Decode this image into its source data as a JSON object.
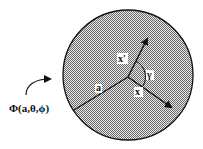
{
  "diagram": {
    "potential_label": "Φ(a,θ,ϕ)",
    "radius_label": "a",
    "vector_x_prime_label": "x'",
    "vector_x_label": "x",
    "angle_label": "γ",
    "colors": {
      "sphere_fill": "#bdbdbd",
      "stroke": "#111111"
    }
  }
}
